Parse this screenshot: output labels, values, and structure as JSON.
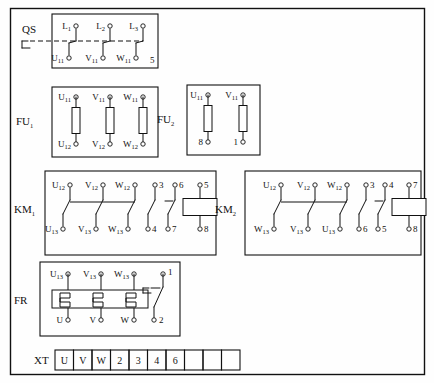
{
  "diagram": {
    "frame_color": "#111111",
    "background": "#ffffff"
  },
  "blocks": {
    "qs": {
      "label": "QS",
      "label_sub": "",
      "top_terminals": [
        {
          "base": "L",
          "sub": "1"
        },
        {
          "base": "L",
          "sub": "2"
        },
        {
          "base": "L",
          "sub": "3"
        }
      ],
      "bottom_terminals": [
        {
          "base": "U",
          "sub": "11"
        },
        {
          "base": "V",
          "sub": "11"
        },
        {
          "base": "W",
          "sub": "11"
        }
      ],
      "extra_label": "5"
    },
    "fu1": {
      "label": "FU",
      "label_sub": "1",
      "top_terminals": [
        {
          "base": "U",
          "sub": "11"
        },
        {
          "base": "V",
          "sub": "11"
        },
        {
          "base": "W",
          "sub": "11"
        }
      ],
      "bottom_terminals": [
        {
          "base": "U",
          "sub": "12"
        },
        {
          "base": "V",
          "sub": "12"
        },
        {
          "base": "W",
          "sub": "12"
        }
      ]
    },
    "fu2": {
      "label": "FU",
      "label_sub": "2",
      "top_terminals": [
        {
          "base": "U",
          "sub": "11"
        },
        {
          "base": "V",
          "sub": "11"
        }
      ],
      "bottom_terminals": [
        {
          "base": "8",
          "sub": ""
        },
        {
          "base": "1",
          "sub": ""
        }
      ]
    },
    "km1": {
      "label": "KM",
      "label_sub": "1",
      "main_top": [
        {
          "base": "U",
          "sub": "12"
        },
        {
          "base": "V",
          "sub": "12"
        },
        {
          "base": "W",
          "sub": "12"
        }
      ],
      "main_bottom": [
        {
          "base": "U",
          "sub": "13"
        },
        {
          "base": "V",
          "sub": "13"
        },
        {
          "base": "W",
          "sub": "13"
        }
      ],
      "aux_no": {
        "top": "3",
        "bottom": "4"
      },
      "aux_nc": {
        "top": "6",
        "bottom": "7"
      },
      "coil": {
        "top": "5",
        "bottom": "8"
      }
    },
    "km2": {
      "label": "KM",
      "label_sub": "2",
      "main_top": [
        {
          "base": "U",
          "sub": "12"
        },
        {
          "base": "V",
          "sub": "12"
        },
        {
          "base": "W",
          "sub": "12"
        }
      ],
      "main_bottom": [
        {
          "base": "W",
          "sub": "13"
        },
        {
          "base": "V",
          "sub": "13"
        },
        {
          "base": "U",
          "sub": "13"
        }
      ],
      "aux_no": {
        "top": "3",
        "bottom": "6"
      },
      "aux_nc": {
        "top": "4",
        "bottom": "5"
      },
      "coil": {
        "top": "7",
        "bottom": "8"
      }
    },
    "fr": {
      "label": "FR",
      "label_sub": "",
      "top_terminals": [
        {
          "base": "U",
          "sub": "13"
        },
        {
          "base": "V",
          "sub": "13"
        },
        {
          "base": "W",
          "sub": "13"
        }
      ],
      "bottom_terminals": [
        {
          "base": "U",
          "sub": ""
        },
        {
          "base": "V",
          "sub": ""
        },
        {
          "base": "W",
          "sub": ""
        }
      ],
      "contact": {
        "top": "1",
        "bottom": "2"
      }
    },
    "xt": {
      "label": "XT",
      "cells": [
        "U",
        "V",
        "W",
        "2",
        "3",
        "4",
        "6",
        "",
        "",
        ""
      ]
    }
  }
}
